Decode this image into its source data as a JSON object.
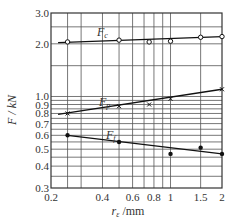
{
  "chart_data": {
    "type": "line",
    "title": "",
    "xlabel": "r_ε /mm",
    "ylabel": "F / kN",
    "xscale": "log",
    "yscale": "log",
    "xlim": [
      0.2,
      2
    ],
    "ylim": [
      0.3,
      3.0
    ],
    "grid": true,
    "x_ticks": [
      "0.2",
      "0.4",
      "0.6",
      "0.8",
      "1",
      "1.5",
      "2"
    ],
    "y_ticks": [
      "0.3",
      "0.4",
      "0.5",
      "0.6",
      "0.7",
      "0.8",
      "0.9",
      "1.0",
      "2.0",
      "3.0"
    ],
    "series": [
      {
        "name": "Fc",
        "marker": "open-circle",
        "x": [
          0.25,
          0.5,
          0.75,
          1.0,
          1.5,
          2.0
        ],
        "values": [
          2.05,
          2.1,
          2.05,
          2.07,
          2.18,
          2.2
        ],
        "fit": [
          [
            0.22,
            2.03
          ],
          [
            2.0,
            2.2
          ]
        ]
      },
      {
        "name": "Fp",
        "marker": "cross",
        "x": [
          0.25,
          0.5,
          0.75,
          1.0,
          2.0
        ],
        "values": [
          0.8,
          0.88,
          0.9,
          0.97,
          1.1
        ],
        "fit": [
          [
            0.22,
            0.79
          ],
          [
            2.0,
            1.1
          ]
        ]
      },
      {
        "name": "Ff",
        "marker": "filled-circle",
        "x": [
          0.25,
          0.5,
          1.0,
          1.5,
          2.0
        ],
        "values": [
          0.6,
          0.55,
          0.47,
          0.51,
          0.47
        ],
        "fit": [
          [
            0.25,
            0.6
          ],
          [
            2.0,
            0.47
          ]
        ]
      }
    ],
    "annotations": [
      "Fc",
      "Fp",
      "Ff"
    ]
  },
  "labels": {
    "xlabel_main": "r",
    "xlabel_sub": "ε",
    "xlabel_unit": " /mm",
    "ylabel": "F / kN",
    "fc_main": "F",
    "fc_sub": "c",
    "fp_main": "F",
    "fp_sub": "p",
    "ff_main": "F",
    "ff_sub": "f"
  }
}
